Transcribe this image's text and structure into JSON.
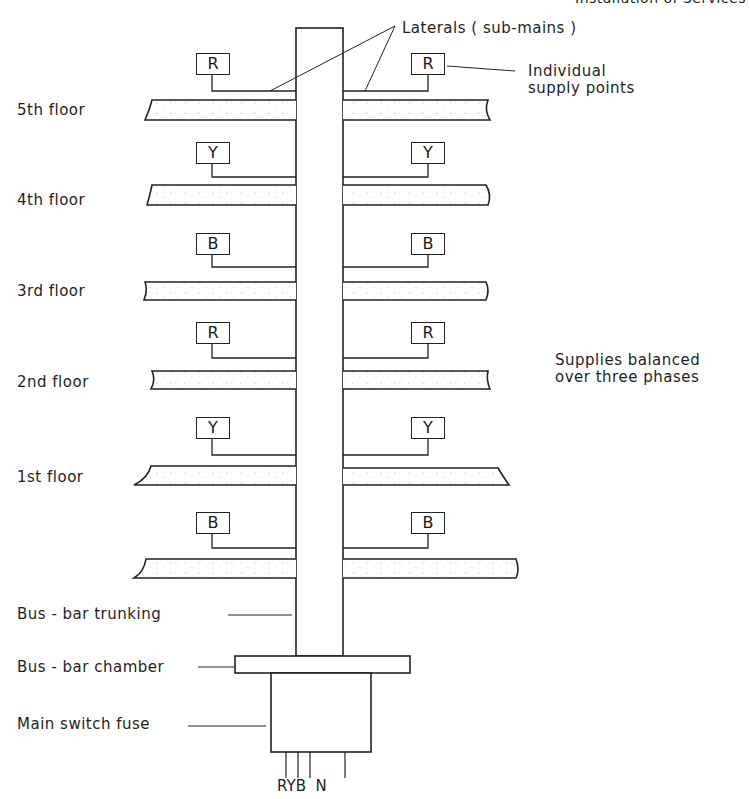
{
  "header": {
    "partial_text": "Installation of Services"
  },
  "labels": {
    "laterals": "Laterals ( sub-mains )",
    "individual_1": "Individual",
    "individual_2": "supply points",
    "balanced_1": "Supplies balanced",
    "balanced_2": "over three phases",
    "trunking": "Bus - bar trunking",
    "chamber": "Bus - bar chamber",
    "fuse": "Main switch fuse",
    "conductors": "RYB  N"
  },
  "floors": [
    {
      "label": "5th floor",
      "phase": "R"
    },
    {
      "label": "4th floor",
      "phase": "Y"
    },
    {
      "label": "3rd floor",
      "phase": "B"
    },
    {
      "label": "2nd floor",
      "phase": "R"
    },
    {
      "label": "1st floor",
      "phase": "Y"
    },
    {
      "label": "",
      "phase": "B"
    }
  ],
  "colors": {
    "line": "#222222",
    "background": "#ffffff"
  }
}
